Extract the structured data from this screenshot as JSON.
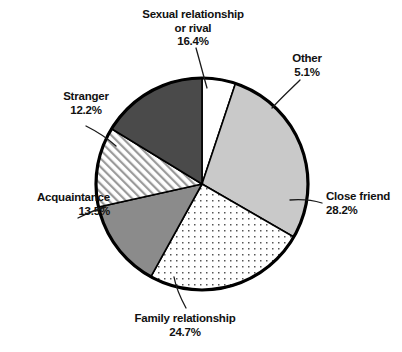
{
  "chart_data": {
    "type": "pie",
    "title": "",
    "subtitle": "",
    "xlabel": "",
    "ylabel": "",
    "legend_position": "callout-labels",
    "grid": false,
    "units": "percent",
    "total": 100.1,
    "start_angle_deg": 0,
    "direction": "clockwise",
    "categories": [
      "Other",
      "Close friend",
      "Family relationship",
      "Acquaintance",
      "Stranger",
      "Sexual relationship or rival"
    ],
    "values": [
      5.1,
      28.2,
      24.7,
      13.5,
      12.2,
      16.4
    ],
    "slices": [
      {
        "key": "other",
        "label": "Other",
        "value": 5.1,
        "percent_text": "5.1%",
        "fill": "#ffffff",
        "pattern": "solid",
        "start_deg": 0.0,
        "end_deg": 18.4
      },
      {
        "key": "close_friend",
        "label": "Close friend",
        "value": 28.2,
        "percent_text": "28.2%",
        "fill": "#c9c9c9",
        "pattern": "solid",
        "start_deg": 18.4,
        "end_deg": 120.0
      },
      {
        "key": "family_relationship",
        "label": "Family relationship",
        "value": 24.7,
        "percent_text": "24.7%",
        "fill": "#ffffff",
        "pattern": "dots",
        "start_deg": 120.0,
        "end_deg": 208.9
      },
      {
        "key": "acquaintance",
        "label": "Acquaintance",
        "value": 13.5,
        "percent_text": "13.5%",
        "fill": "#8b8b8b",
        "pattern": "solid",
        "start_deg": 208.9,
        "end_deg": 257.5
      },
      {
        "key": "stranger",
        "label": "Stranger",
        "value": 12.2,
        "percent_text": "12.2%",
        "fill": "#ffffff",
        "pattern": "diagonal-hatch",
        "start_deg": 257.5,
        "end_deg": 301.4
      },
      {
        "key": "sexual_relationship_or_rival",
        "label": "Sexual relationship or rival",
        "value": 16.4,
        "percent_text": "16.4%",
        "fill": "#4a4a4a",
        "pattern": "solid",
        "start_deg": 301.4,
        "end_deg": 360.0
      }
    ],
    "colors": {
      "outline": "#000000",
      "background": "#ffffff",
      "text": "#111111",
      "dark_gray": "#4a4a4a",
      "medium_gray": "#8b8b8b",
      "light_gray": "#c9c9c9"
    }
  },
  "labels": {
    "sexual": {
      "line1": "Sexual relationship",
      "line2": "or rival",
      "percent": "16.4%"
    },
    "other": {
      "line1": "Other",
      "percent": "5.1%"
    },
    "close_friend": {
      "line1": "Close friend",
      "percent": "28.2%"
    },
    "family": {
      "line1": "Family relationship",
      "percent": "24.7%"
    },
    "acquaintance": {
      "line1": "Acquaintance",
      "percent": "13.5%"
    },
    "stranger": {
      "line1": "Stranger",
      "percent": "12.2%"
    }
  }
}
